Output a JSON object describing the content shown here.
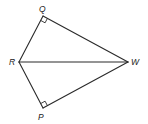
{
  "diagram": {
    "type": "geometry-figure",
    "colors": {
      "stroke": "#2a2a2a",
      "label": "#222222",
      "background": "#ffffff"
    },
    "vertices": {
      "Q": {
        "label": "Q",
        "x": 43,
        "y": 16,
        "lx": 39,
        "ly": 12
      },
      "R": {
        "label": "R",
        "x": 19,
        "y": 62,
        "lx": 9,
        "ly": 65
      },
      "W": {
        "label": "W",
        "x": 128,
        "y": 62,
        "lx": 131,
        "ly": 65
      },
      "P": {
        "label": "P",
        "x": 43,
        "y": 108,
        "lx": 38,
        "ly": 120
      }
    },
    "segments": [
      {
        "name": "QR",
        "from": "Q",
        "to": "R"
      },
      {
        "name": "QW",
        "from": "Q",
        "to": "W"
      },
      {
        "name": "RW",
        "from": "R",
        "to": "W"
      },
      {
        "name": "RP",
        "from": "R",
        "to": "P"
      },
      {
        "name": "PW",
        "from": "P",
        "to": "W"
      }
    ],
    "right_angles": [
      "Q",
      "P"
    ]
  }
}
